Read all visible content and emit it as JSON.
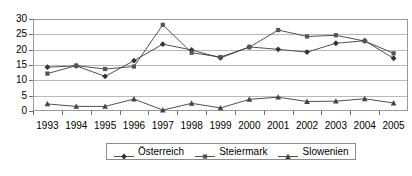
{
  "chart_data": {
    "type": "line",
    "title": "",
    "subtitle": "",
    "xlabel": "",
    "ylabel": "",
    "categories": [
      "1993",
      "1994",
      "1995",
      "1996",
      "1997",
      "1998",
      "1999",
      "2000",
      "2001",
      "2002",
      "2003",
      "2004",
      "2005"
    ],
    "ylim": [
      0,
      30
    ],
    "ytick_labels": [
      "0",
      "5",
      "10",
      "15",
      "20",
      "25",
      "30"
    ],
    "ytick_values": [
      0,
      5,
      10,
      15,
      20,
      25,
      30
    ],
    "grid": "horizontal",
    "legend_position": "bottom-center",
    "series": [
      {
        "name": "Österreich",
        "marker": "diamond",
        "color": "#333333",
        "values": [
          14.3,
          14.7,
          11.3,
          16.4,
          21.8,
          19.9,
          17.3,
          20.9,
          20.1,
          19.2,
          22.1,
          22.9,
          17.2
        ]
      },
      {
        "name": "Steiermark",
        "marker": "square",
        "color": "#555555",
        "values": [
          12.2,
          14.8,
          13.7,
          14.5,
          28.1,
          19.0,
          17.6,
          20.8,
          26.4,
          24.3,
          24.7,
          22.8,
          18.8
        ]
      },
      {
        "name": "Slowenien",
        "marker": "triangle",
        "color": "#444444",
        "values": [
          2.3,
          1.5,
          1.5,
          3.9,
          0.3,
          2.5,
          1.0,
          3.8,
          4.5,
          3.1,
          3.2,
          4.0,
          2.6
        ]
      }
    ]
  },
  "legend": {
    "entries": [
      {
        "label": "Österreich"
      },
      {
        "label": "Steiermark"
      },
      {
        "label": "Slowenien"
      }
    ]
  },
  "colors": {
    "plot_border": "#9a9a9a",
    "gridline": "#b9b9b9",
    "axis_text": "#000000",
    "series_line": "#3c3c3c",
    "background": "#ffffff"
  }
}
